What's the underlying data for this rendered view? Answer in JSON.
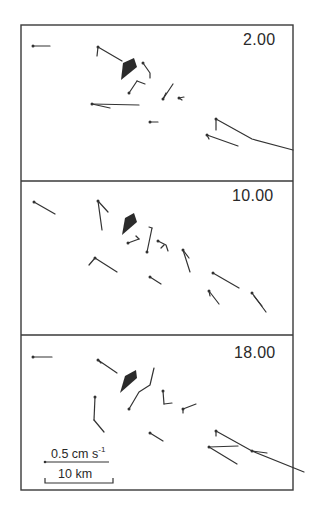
{
  "figure": {
    "frame": {
      "left": 21,
      "top": 25,
      "right": 293,
      "bottom": 490,
      "color": "#3a3a3a"
    },
    "dividers_y": [
      181,
      335
    ],
    "panels": [
      {
        "label": "2.00",
        "label_pos": {
          "x": 243,
          "y": 41
        },
        "land": [
          [
            123,
            63
          ],
          [
            134,
            58
          ],
          [
            137,
            67
          ],
          [
            121,
            80
          ]
        ],
        "vectors": [
          {
            "points": [
              [
                33,
                46
              ],
              [
                50,
                46
              ]
            ]
          },
          {
            "points": [
              [
                98,
                47
              ],
              [
                122,
                61
              ]
            ],
            "hook": [
              [
                98,
                47
              ],
              [
                97,
                56
              ]
            ]
          },
          {
            "points": [
              [
                143,
                63
              ],
              [
                150,
                73
              ],
              [
                150,
                78
              ]
            ]
          },
          {
            "points": [
              [
                129,
                93
              ],
              [
                137,
                81
              ]
            ],
            "hook": [
              [
                137,
                81
              ],
              [
                145,
                84
              ]
            ]
          },
          {
            "points": [
              [
                163,
                99
              ],
              [
                173,
                84
              ]
            ],
            "hook": [
              [
                163,
                99
              ],
              [
                166,
                93
              ]
            ]
          },
          {
            "points": [
              [
                179,
                98
              ],
              [
                182,
                100
              ]
            ],
            "hook": [
              [
                179,
                98
              ],
              [
                184,
                97
              ]
            ]
          },
          {
            "points": [
              [
                92,
                104
              ],
              [
                139,
                105
              ]
            ],
            "hook": [
              [
                92,
                104
              ],
              [
                110,
                108
              ]
            ]
          },
          {
            "points": [
              [
                150,
                122
              ],
              [
                158,
                122
              ]
            ]
          },
          {
            "points": [
              [
                216,
                119
              ],
              [
                252,
                139
              ],
              [
                293,
                150
              ]
            ],
            "hook": [
              [
                216,
                119
              ],
              [
                216,
                130
              ]
            ]
          },
          {
            "points": [
              [
                207,
                135
              ],
              [
                238,
                146
              ]
            ],
            "hook": [
              [
                207,
                135
              ],
              [
                209,
                139
              ]
            ]
          }
        ]
      },
      {
        "label": "10.00",
        "label_pos": {
          "x": 232,
          "y": 197
        },
        "land": [
          [
            125,
            218
          ],
          [
            134,
            213
          ],
          [
            137,
            222
          ],
          [
            122,
            235
          ]
        ],
        "vectors": [
          {
            "points": [
              [
                34,
                202
              ],
              [
                55,
                214
              ]
            ]
          },
          {
            "points": [
              [
                98,
                201
              ],
              [
                102,
                230
              ]
            ],
            "hook": [
              [
                98,
                201
              ],
              [
                108,
                212
              ]
            ]
          },
          {
            "points": [
              [
                128,
                243
              ],
              [
                139,
                239
              ]
            ],
            "hook": [
              [
                139,
                239
              ],
              [
                136,
                236
              ]
            ]
          },
          {
            "points": [
              [
                147,
                252
              ],
              [
                152,
                228
              ]
            ],
            "hook": [
              [
                152,
                228
              ],
              [
                149,
                227
              ]
            ]
          },
          {
            "points": [
              [
                158,
                241
              ],
              [
                166,
                245
              ],
              [
                168,
                251
              ]
            ],
            "hook": [
              [
                164,
                245
              ],
              [
                161,
                248
              ]
            ]
          },
          {
            "points": [
              [
                183,
                250
              ],
              [
                190,
                272
              ]
            ],
            "hook": [
              [
                183,
                250
              ],
              [
                189,
                258
              ]
            ]
          },
          {
            "points": [
              [
                95,
                258
              ],
              [
                117,
                272
              ]
            ],
            "hook": [
              [
                95,
                258
              ],
              [
                89,
                265
              ]
            ]
          },
          {
            "points": [
              [
                150,
                277
              ],
              [
                161,
                284
              ]
            ]
          },
          {
            "points": [
              [
                213,
                273
              ],
              [
                239,
                288
              ]
            ]
          },
          {
            "points": [
              [
                209,
                291
              ],
              [
                219,
                304
              ]
            ],
            "hook": [
              [
                209,
                291
              ],
              [
                210,
                296
              ]
            ]
          },
          {
            "points": [
              [
                252,
                293
              ],
              [
                266,
                312
              ]
            ],
            "hook": [
              [
                254,
                296
              ],
              [
                262,
                306
              ]
            ]
          }
        ]
      },
      {
        "label": "18.00",
        "label_pos": {
          "x": 234,
          "y": 354
        },
        "land": [
          [
            125,
            376
          ],
          [
            136,
            370
          ],
          [
            137,
            378
          ],
          [
            120,
            393
          ]
        ],
        "vectors": [
          {
            "points": [
              [
                33,
                357
              ],
              [
                52,
                357
              ]
            ]
          },
          {
            "points": [
              [
                98,
                360
              ],
              [
                117,
                373
              ]
            ],
            "hook": [
              [
                98,
                360
              ],
              [
                101,
                363
              ]
            ]
          },
          {
            "points": [
              [
                129,
                409
              ],
              [
                139,
                392
              ],
              [
                150,
                385
              ],
              [
                154,
                368
              ]
            ]
          },
          {
            "points": [
              [
                95,
                397
              ],
              [
                94,
                420
              ]
            ],
            "hook": [
              [
                94,
                420
              ],
              [
                104,
                432
              ]
            ]
          },
          {
            "points": [
              [
                163,
                391
              ],
              [
                164,
                404
              ]
            ],
            "hook": [
              [
                164,
                404
              ],
              [
                172,
                403
              ]
            ]
          },
          {
            "points": [
              [
                183,
                409
              ],
              [
                196,
                404
              ]
            ],
            "hook": [
              [
                183,
                409
              ],
              [
                183,
                413
              ]
            ]
          },
          {
            "points": [
              [
                150,
                433
              ],
              [
                163,
                441
              ]
            ]
          },
          {
            "points": [
              [
                216,
                431
              ],
              [
                252,
                451
              ],
              [
                304,
                472
              ]
            ],
            "hook": [
              [
                216,
                431
              ],
              [
                216,
                436
              ]
            ]
          },
          {
            "points": [
              [
                209,
                447
              ],
              [
                237,
                464
              ]
            ],
            "hook": [
              [
                209,
                447
              ],
              [
                238,
                446
              ]
            ]
          },
          {
            "points": [
              [
                252,
                451
              ],
              [
                267,
                453
              ]
            ]
          }
        ]
      }
    ],
    "land_color": "#2b2b2b",
    "vector_color": "#333333"
  },
  "scale": {
    "velocity_label": "0.5 cm s",
    "velocity_exponent": "-1",
    "velocity_bar": {
      "x1": 45,
      "x2": 109,
      "y": 462
    },
    "distance_label": "10 km",
    "distance_bar": {
      "x1": 45,
      "x2": 113,
      "y": 483
    }
  }
}
